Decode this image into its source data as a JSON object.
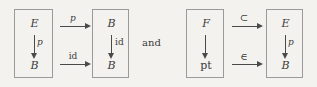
{
  "figure": {
    "background_color": "#f4f2ee",
    "ink_color": "#3b3b3b",
    "rule_color": "#9a9a9a",
    "conjunction": "and"
  },
  "diagrams": [
    {
      "id": "left",
      "source_square": {
        "top_object": "E",
        "bottom_object": "B",
        "vertical_label": "p",
        "vertical_label_style": "italic"
      },
      "target_square": {
        "top_object": "B",
        "bottom_object": "B",
        "vertical_label": "id",
        "vertical_label_style": "roman"
      },
      "horizontal_arrows": [
        {
          "label": "p",
          "style": "italic",
          "position": "top"
        },
        {
          "label": "id",
          "style": "roman",
          "position": "bottom"
        }
      ]
    },
    {
      "id": "right",
      "source_square": {
        "top_object": "F",
        "bottom_object": "pt",
        "vertical_label": "",
        "vertical_label_style": "roman"
      },
      "target_square": {
        "top_object": "E",
        "bottom_object": "B",
        "vertical_label": "p",
        "vertical_label_style": "italic"
      },
      "horizontal_arrows": [
        {
          "label": "⊂",
          "style": "sym",
          "position": "top"
        },
        {
          "label": "∈",
          "style": "sym",
          "position": "bottom"
        }
      ]
    }
  ]
}
